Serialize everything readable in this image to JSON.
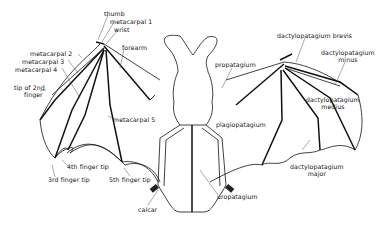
{
  "diagram": {
    "labels": {
      "thumb": "thumb",
      "metacarpal1": "metacarpal 1",
      "wrist": "wrist",
      "forearm": "forearm",
      "metacarpal2": "metacarpal 2",
      "metacarpal3": "metacarpal 3",
      "metacarpal4": "metacarpal 4",
      "tip2_line1": "tip of 2nd",
      "tip2_line2": "finger",
      "metacarpal5": "metacarpal 5",
      "tip4": "4th finger tip",
      "tip3": "3rd finger tip",
      "tip5": "5th finger tip",
      "calcar": "calcar",
      "propatagium": "propatagium",
      "brevis": "dactylopatagium  brevis",
      "minus_line1": "dactylopatagium",
      "minus_line2": "minus",
      "medius_line1": "dactylopatagium",
      "medius_line2": "medius",
      "plagiopatagium": "plagiopatagium",
      "major_line1": "dactylopatagium",
      "major_line2": "major",
      "uropatagium": "uropatagium"
    },
    "colors": {
      "line": "#111111",
      "background": "#ffffff"
    }
  }
}
